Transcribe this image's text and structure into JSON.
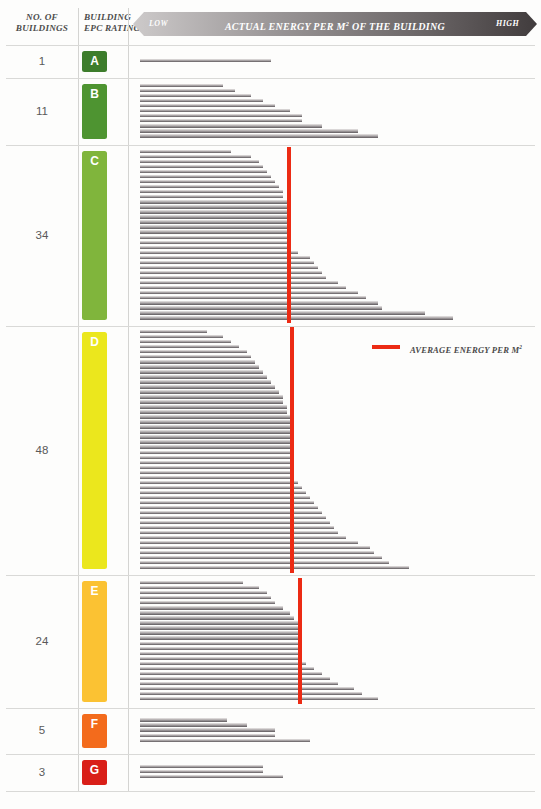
{
  "header": {
    "col_count_line1": "NO. OF",
    "col_count_line2": "BUILDINGS",
    "col_rating_line1": "BUILDING",
    "col_rating_line2": "EPC RATING",
    "banner_low": "LOW",
    "banner_title": "ACTUAL ENERGY PER M² OF THE BUILDING",
    "banner_high": "HIGH"
  },
  "legend": {
    "label": "AVERAGE ENERGY PER M²",
    "color": "#ec2b14"
  },
  "colors": {
    "A": "#3d7d2c",
    "B": "#4e9431",
    "C": "#80b53c",
    "D": "#ebe71d",
    "E": "#fbc233",
    "F": "#f36b1c",
    "G": "#d91f18",
    "bar_light": "#e9e7e7",
    "bar_dark": "#5d585b",
    "grid": "#d9d9d7",
    "banner_left": "#c9c6c6",
    "banner_right": "#4a4546"
  },
  "chart_data": {
    "type": "bar",
    "xlabel": "Actual energy per m² (low to high)",
    "ylabel": "Individual buildings grouped by EPC rating",
    "grid": false,
    "legend_position": "inside-right",
    "orientation": "horizontal",
    "axis_note": "Bar lengths are relative (0-100 scale of plot width); no numeric ticks are printed on the chart.",
    "xlim": [
      0,
      100
    ],
    "groups": [
      {
        "rating": "A",
        "count": 1,
        "count_label": "1",
        "color": "#3d7d2c",
        "average_line": null,
        "values": [
          33
        ]
      },
      {
        "rating": "B",
        "count": 11,
        "count_label": "11",
        "color": "#4e9431",
        "average_line": null,
        "values": [
          21,
          24,
          28,
          31,
          34,
          38,
          41,
          41,
          46,
          55,
          60
        ]
      },
      {
        "rating": "C",
        "count": 34,
        "count_label": "34",
        "color": "#80b53c",
        "average_line": 37,
        "values": [
          23,
          28,
          30,
          31,
          32,
          33,
          34,
          35,
          36,
          36,
          37,
          37,
          38,
          38,
          38,
          38,
          38,
          38,
          38,
          38,
          40,
          43,
          44,
          45,
          46,
          47,
          50,
          52,
          55,
          57,
          60,
          61,
          72,
          79
        ]
      },
      {
        "rating": "D",
        "count": 48,
        "count_label": "48",
        "color": "#ebe71d",
        "average_line": 38,
        "values": [
          17,
          21,
          23,
          25,
          27,
          28,
          29,
          30,
          31,
          32,
          33,
          34,
          35,
          36,
          36,
          37,
          37,
          38,
          38,
          38,
          38,
          38,
          38,
          38,
          38,
          38,
          38,
          38,
          38,
          39,
          40,
          41,
          42,
          43,
          44,
          45,
          46,
          47,
          48,
          49,
          50,
          52,
          55,
          58,
          59,
          61,
          63,
          68
        ]
      },
      {
        "rating": "E",
        "count": 24,
        "count_label": "24",
        "color": "#fbc233",
        "average_line": 40,
        "values": [
          26,
          30,
          32,
          33,
          34,
          36,
          38,
          39,
          40,
          40,
          40,
          40,
          40,
          40,
          40,
          40,
          42,
          44,
          46,
          48,
          50,
          54,
          56,
          60
        ]
      },
      {
        "rating": "F",
        "count": 5,
        "count_label": "5",
        "color": "#f36b1c",
        "average_line": null,
        "values": [
          22,
          27,
          34,
          34,
          43
        ]
      },
      {
        "rating": "G",
        "count": 3,
        "count_label": "3",
        "color": "#d91f18",
        "average_line": null,
        "values": [
          31,
          31,
          36
        ]
      }
    ]
  },
  "layout": {
    "rows": [
      {
        "rating": "A",
        "top": 45,
        "height": 33
      },
      {
        "rating": "B",
        "top": 78,
        "height": 67
      },
      {
        "rating": "C",
        "top": 145,
        "height": 181
      },
      {
        "rating": "D",
        "top": 326,
        "height": 249
      },
      {
        "rating": "E",
        "top": 575,
        "height": 133
      },
      {
        "rating": "F",
        "top": 708,
        "height": 46
      },
      {
        "rating": "G",
        "top": 754,
        "height": 37
      }
    ],
    "plot_left": 140,
    "plot_width": 396,
    "bar_pitch": 5.05,
    "bar_height": 3.4
  }
}
